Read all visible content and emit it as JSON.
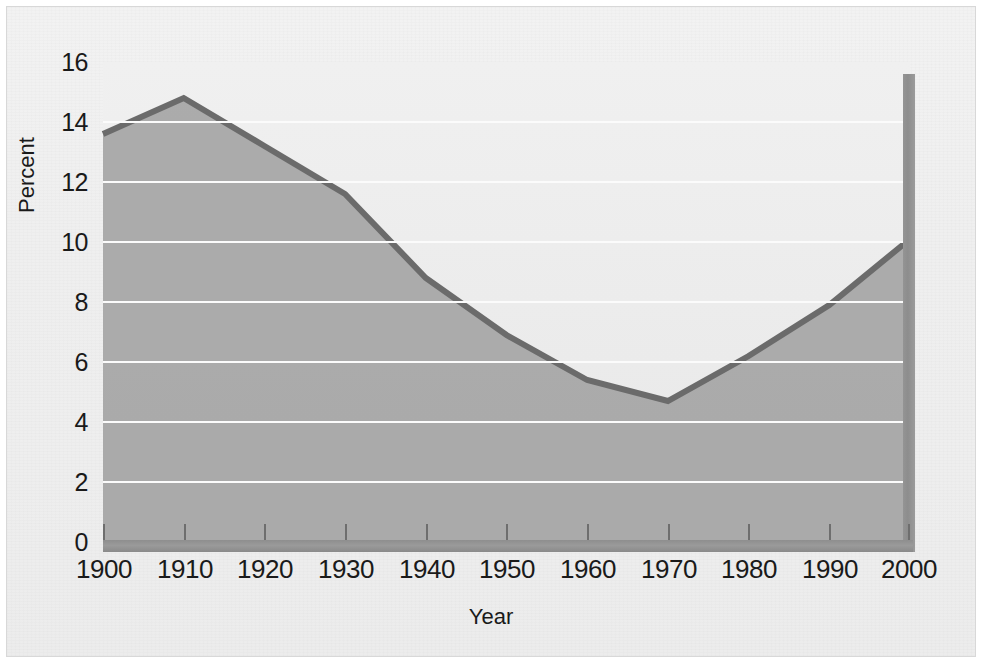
{
  "figure": {
    "background_color": "#eeeeee",
    "frame_color": "#d8d8d8",
    "area_fill_color": "#9c9c9c",
    "line_color": "#6b6b6b",
    "gridline_color": "#fbfbfb",
    "axis_bar_color": "#8e8e8e",
    "spike_color": "#949494"
  },
  "chart_data": {
    "type": "area",
    "title": "",
    "subtitle": "",
    "xlabel": "Year",
    "ylabel": "Percent",
    "grid": true,
    "gridlines_horizontal_only": true,
    "legend": "none",
    "xlim": [
      1900,
      2000
    ],
    "ylim": [
      0,
      16
    ],
    "ytick_labels": [
      "0",
      "2",
      "4",
      "6",
      "8",
      "10",
      "12",
      "14",
      "16"
    ],
    "yticks": [
      0,
      2,
      4,
      6,
      8,
      10,
      12,
      14,
      16
    ],
    "xtick_labels": [
      "1900",
      "1910",
      "1920",
      "1930",
      "1940",
      "1950",
      "1960",
      "1970",
      "1980",
      "1990",
      "2000"
    ],
    "xticks": [
      1900,
      1910,
      1920,
      1930,
      1940,
      1950,
      1960,
      1970,
      1980,
      1990,
      2000
    ],
    "x": [
      1900,
      1910,
      1920,
      1930,
      1940,
      1950,
      1960,
      1970,
      1980,
      1990,
      2000
    ],
    "values": [
      13.6,
      14.8,
      13.2,
      11.6,
      8.8,
      6.9,
      5.4,
      4.7,
      6.2,
      7.9,
      10.1
    ],
    "series": [
      {
        "name": "Percent",
        "values": [
          13.6,
          14.8,
          13.2,
          11.6,
          8.8,
          6.9,
          5.4,
          4.7,
          6.2,
          7.9,
          10.1
        ]
      }
    ],
    "annotations": [
      {
        "kind": "vertical-bar",
        "x": 2001,
        "value": 15.6,
        "description": "tall vertical bar at right edge of plot"
      }
    ],
    "peak": {
      "x": 1910,
      "value": 14.8
    },
    "minimum": {
      "x": 1970,
      "value": 4.7
    }
  }
}
